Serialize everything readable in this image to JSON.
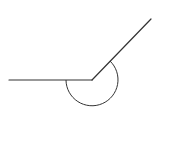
{
  "diagram": {
    "type": "reflex-angle",
    "background": "#ffffff",
    "stroke_color": "#333333",
    "vertex": {
      "x": 92,
      "y": 80
    },
    "ray_left_end": {
      "x": 9,
      "y": 80
    },
    "ray_upper_right_end": {
      "x": 151,
      "y": 19
    },
    "arc": {
      "radius": 26,
      "start": {
        "x": 66,
        "y": 80
      },
      "end": {
        "x": 110,
        "y": 61
      }
    }
  }
}
